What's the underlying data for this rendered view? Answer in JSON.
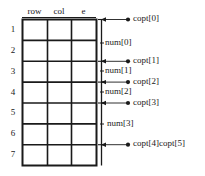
{
  "diagram": {
    "colors": {
      "line": "#1a1a1a",
      "text": "#1a1a1a",
      "background": "#ffffff"
    },
    "table": {
      "headers": [
        "row",
        "col",
        "e"
      ],
      "row_labels": [
        "1",
        "2",
        "3",
        "4",
        "5",
        "6",
        "7"
      ],
      "row_count": 7,
      "column_count": 3,
      "cells": [
        [
          "",
          "",
          ""
        ],
        [
          "",
          "",
          ""
        ],
        [
          "",
          "",
          ""
        ],
        [
          "",
          "",
          ""
        ],
        [
          "",
          "",
          ""
        ],
        [
          "",
          "",
          ""
        ],
        [
          "",
          "",
          ""
        ]
      ]
    },
    "boundary_markers": [
      {
        "label": "copt[0]",
        "at_row_boundary": 0
      },
      {
        "label": "copt[1]",
        "at_row_boundary": 2
      },
      {
        "label": "copt[2]",
        "at_row_boundary": 3
      },
      {
        "label": "copt[3]",
        "at_row_boundary": 4
      },
      {
        "label": "copt[4]copt[5]",
        "at_row_boundary": 6
      }
    ],
    "span_labels": [
      {
        "label": "num[0]",
        "between": [
          0,
          2
        ]
      },
      {
        "label": "num[1]",
        "between": [
          2,
          3
        ]
      },
      {
        "label": "num[2]",
        "between": [
          3,
          4
        ]
      },
      {
        "label": "num[3]",
        "between": [
          4,
          6
        ]
      }
    ]
  }
}
